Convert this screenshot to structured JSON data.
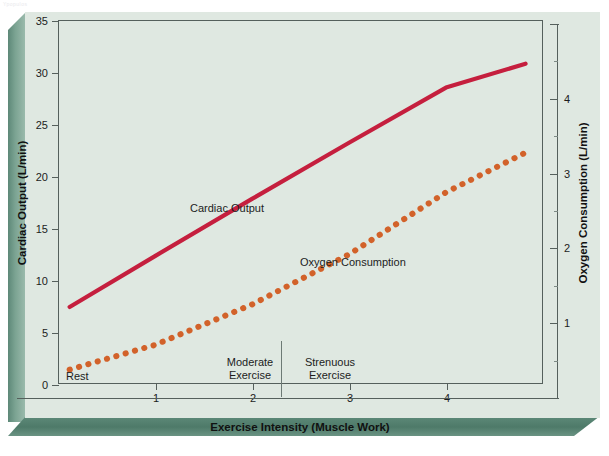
{
  "watermark": "Ypopulos",
  "chart_data": {
    "type": "line",
    "title": "",
    "subtitle": "",
    "xlabel": "Exercise Intensity (Muscle Work)",
    "ylabel": "Cardiac Output (L/min)",
    "y2label": "Oxygen Consumption (L/min)",
    "xlim": [
      0,
      5
    ],
    "ylim": [
      0,
      35
    ],
    "y2lim": [
      0,
      5
    ],
    "grid": false,
    "legend": "inline-labels",
    "xticks": [
      1,
      2,
      3,
      4
    ],
    "xticklabels": [
      "1",
      "2",
      "3",
      "4"
    ],
    "yticks": [
      0,
      5,
      10,
      15,
      20,
      25,
      30,
      35
    ],
    "yticklabels": [
      "0",
      "5",
      "10",
      "15",
      "20",
      "25",
      "30",
      "35"
    ],
    "y2ticks": [
      1,
      2,
      3,
      4
    ],
    "y2ticklabels": [
      "1",
      "2",
      "3",
      "4"
    ],
    "series": [
      {
        "name": "Cardiac Output",
        "axis": "left",
        "style": "solid",
        "color": "#C51F3E",
        "x": [
          0.12,
          1.0,
          2.0,
          3.0,
          4.0,
          4.82
        ],
        "values": [
          7.4,
          12.3,
          17.8,
          23.2,
          28.5,
          30.8
        ]
      },
      {
        "name": "Oxygen Consumption",
        "axis": "right",
        "style": "dotted",
        "color": "#D2622A",
        "x": [
          0.12,
          1.0,
          2.0,
          3.0,
          4.0,
          4.82
        ],
        "values": [
          0.38,
          0.71,
          1.25,
          1.92,
          2.75,
          3.28
        ]
      }
    ],
    "series_labels": [
      {
        "text": "Cardiac Output",
        "x_px": 190,
        "y_px": 202
      },
      {
        "text": "Oxygen Consumption",
        "x_px": 300,
        "y_px": 256
      }
    ],
    "annotations": [
      {
        "name": "zone-rest",
        "text": "Rest",
        "lines": [
          "Rest"
        ]
      },
      {
        "name": "zone-moderate",
        "text": "Moderate Exercise",
        "lines": [
          "Moderate",
          "Exercise"
        ]
      },
      {
        "name": "zone-strenuous",
        "text": "Strenuous Exercise",
        "lines": [
          "Strenuous",
          "Exercise"
        ]
      }
    ],
    "divider_x_value": 2.3,
    "colors": {
      "card_face": "#dfe8e1",
      "bevel": "#5d8878",
      "frame": "#55605c",
      "cardiac_output": "#C51F3E",
      "oxygen_consumption": "#D2622A"
    }
  }
}
